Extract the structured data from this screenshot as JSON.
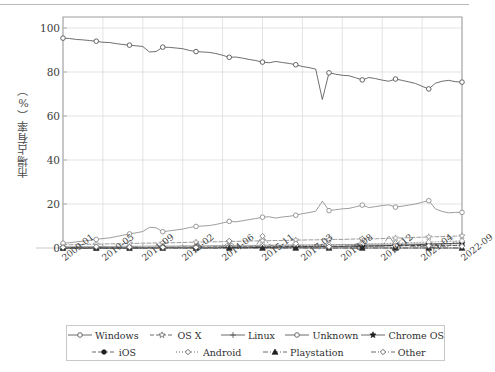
{
  "chart_data": {
    "type": "line",
    "title": "",
    "xlabel": "",
    "ylabel": "市場占有率（%）",
    "ylim": [
      0,
      105
    ],
    "yticks": [
      0,
      20,
      40,
      60,
      80,
      100
    ],
    "grid": true,
    "legend_position": "bottom",
    "x_tick_labels": [
      "2009-01",
      "2010-05",
      "2011-09",
      "2013-02",
      "2014-06",
      "2015-11",
      "2017-03",
      "2018-08",
      "2019-12",
      "2021-04",
      "2022-09"
    ],
    "x_range": [
      "2009-01",
      "2022-09"
    ],
    "series": [
      {
        "name": "Windows",
        "marker": "circle-open",
        "linestyle": "solid",
        "color": "#555555",
        "values": [
          95.4,
          95.2,
          94.8,
          94.6,
          94.3,
          94.0,
          93.5,
          93.4,
          92.9,
          92.5,
          92.2,
          91.9,
          91.6,
          89.1,
          89.3,
          91.3,
          91.2,
          90.9,
          90.6,
          89.8,
          89.3,
          89.1,
          88.9,
          88.4,
          87.6,
          86.7,
          86.8,
          86.3,
          85.7,
          85.2,
          84.5,
          84.2,
          84.8,
          84.3,
          83.9,
          83.3,
          82.5,
          82.0,
          81.3,
          67.5,
          79.6,
          79.0,
          78.5,
          78.3,
          77.4,
          76.4,
          77.5,
          77.0,
          76.3,
          75.8,
          76.8,
          76.2,
          75.5,
          74.8,
          73.5,
          72.3,
          74.9,
          75.8,
          76.2,
          75.6,
          75.4
        ]
      },
      {
        "name": "OS X",
        "marker": "star",
        "linestyle": "dashed",
        "color": "#8a8a8a",
        "values": [
          1.4,
          1.5,
          1.5,
          1.6,
          1.7,
          1.7,
          1.8,
          1.9,
          1.9,
          2.0,
          2.1,
          2.1,
          2.2,
          2.2,
          2.3,
          2.3,
          2.4,
          2.4,
          2.5,
          2.6,
          2.6,
          2.7,
          2.8,
          2.8,
          2.9,
          3.0,
          3.0,
          3.1,
          3.2,
          3.2,
          3.3,
          3.3,
          3.4,
          3.4,
          3.5,
          3.6,
          3.6,
          3.7,
          3.7,
          3.8,
          3.8,
          3.9,
          3.9,
          4.0,
          4.1,
          4.1,
          4.2,
          4.2,
          4.3,
          4.4,
          4.5,
          4.6,
          4.7,
          4.8,
          4.9,
          5.0,
          5.1,
          5.2,
          5.3,
          5.4,
          5.5
        ]
      },
      {
        "name": "Linux",
        "marker": "plus",
        "linestyle": "solid",
        "color": "#9a9a9a",
        "values": [
          0.6,
          0.6,
          0.6,
          0.6,
          0.7,
          0.7,
          0.7,
          0.7,
          0.7,
          0.8,
          0.8,
          0.8,
          0.8,
          0.9,
          0.9,
          0.9,
          0.9,
          0.9,
          1.0,
          1.0,
          1.0,
          1.0,
          1.1,
          1.1,
          1.1,
          1.1,
          1.2,
          1.2,
          1.2,
          1.2,
          1.3,
          1.3,
          1.3,
          1.3,
          1.4,
          1.4,
          1.4,
          1.4,
          1.5,
          1.5,
          1.5,
          1.5,
          1.6,
          1.6,
          1.6,
          1.6,
          1.7,
          1.7,
          1.7,
          1.7,
          1.8,
          1.8,
          1.8,
          1.9,
          1.9,
          1.9,
          2.0,
          2.0,
          2.0,
          2.1,
          2.1
        ]
      },
      {
        "name": "Unknown",
        "marker": "circle-open",
        "linestyle": "solid",
        "color": "#8d8d8d",
        "values": [
          2.2,
          2.4,
          2.8,
          3.1,
          3.5,
          3.9,
          4.3,
          4.6,
          5.2,
          5.8,
          6.4,
          6.9,
          7.5,
          9.4,
          9.2,
          7.4,
          7.8,
          8.2,
          8.6,
          9.3,
          9.8,
          10.0,
          10.2,
          10.7,
          11.4,
          12.1,
          11.9,
          12.4,
          12.9,
          13.4,
          14.0,
          14.2,
          13.6,
          14.1,
          14.4,
          14.9,
          15.6,
          16.1,
          16.7,
          21.3,
          17.0,
          17.4,
          17.8,
          18.0,
          18.7,
          19.5,
          18.4,
          18.8,
          19.3,
          19.6,
          18.6,
          19.0,
          19.5,
          20.0,
          20.8,
          21.5,
          17.8,
          16.6,
          16.0,
          16.2,
          16.2
        ]
      },
      {
        "name": "Chrome OS",
        "marker": "star-filled",
        "linestyle": "solid",
        "color": "#3a3a3a",
        "values": [
          0.0,
          0.0,
          0.0,
          0.0,
          0.0,
          0.0,
          0.0,
          0.0,
          0.0,
          0.0,
          0.0,
          0.0,
          0.0,
          0.1,
          0.1,
          0.1,
          0.1,
          0.1,
          0.1,
          0.1,
          0.1,
          0.1,
          0.1,
          0.1,
          0.2,
          0.2,
          0.2,
          0.2,
          0.2,
          0.2,
          0.3,
          0.3,
          0.3,
          0.3,
          0.4,
          0.4,
          0.4,
          0.5,
          0.5,
          0.6,
          0.6,
          0.7,
          0.7,
          0.8,
          0.8,
          0.9,
          0.9,
          1.0,
          1.0,
          1.1,
          1.2,
          1.3,
          1.4,
          1.5,
          1.6,
          1.7,
          1.8,
          1.9,
          2.0,
          2.1,
          2.2
        ]
      },
      {
        "name": "iOS",
        "marker": "circle-filled",
        "linestyle": "dashed",
        "color": "#1f1f1f",
        "values": [
          0.1,
          0.1,
          0.1,
          0.1,
          0.1,
          0.1,
          0.1,
          0.1,
          0.2,
          0.2,
          0.2,
          0.2,
          0.2,
          0.3,
          0.3,
          0.3,
          0.3,
          0.3,
          0.4,
          0.4,
          0.4,
          0.4,
          0.4,
          0.5,
          0.5,
          0.5,
          0.5,
          0.5,
          0.6,
          0.6,
          0.6,
          0.6,
          0.6,
          0.7,
          0.7,
          0.7,
          0.7,
          0.7,
          0.8,
          0.8,
          0.8,
          0.8,
          0.8,
          0.9,
          0.9,
          0.9,
          0.9,
          0.9,
          1.0,
          1.0,
          1.0,
          1.0,
          1.1,
          1.1,
          1.1,
          1.1,
          1.2,
          1.2,
          1.2,
          1.2,
          1.3
        ]
      },
      {
        "name": "Android",
        "marker": "diamond-open",
        "linestyle": "dotted",
        "color": "#909090",
        "values": [
          0.0,
          0.0,
          0.0,
          0.0,
          0.0,
          0.0,
          0.0,
          0.1,
          0.1,
          0.1,
          0.1,
          0.1,
          0.2,
          0.2,
          0.2,
          0.2,
          0.3,
          0.3,
          0.3,
          0.4,
          0.4,
          0.4,
          0.5,
          0.5,
          0.6,
          0.6,
          0.7,
          0.7,
          0.8,
          0.8,
          0.9,
          0.9,
          1.0,
          1.0,
          1.1,
          1.1,
          1.2,
          1.2,
          1.3,
          1.4,
          1.4,
          1.5,
          1.6,
          1.6,
          1.7,
          1.8,
          1.9,
          1.9,
          2.0,
          2.1,
          2.2,
          2.3,
          2.4,
          2.5,
          2.6,
          2.7,
          2.8,
          2.9,
          3.0,
          3.1,
          3.2
        ]
      },
      {
        "name": "Playstation",
        "marker": "triangle-filled",
        "linestyle": "dashdot",
        "color": "#2a2a2a",
        "values": [
          0.0,
          0.0,
          0.0,
          0.0,
          0.0,
          0.0,
          0.0,
          0.0,
          0.0,
          0.0,
          0.0,
          0.0,
          0.0,
          0.0,
          0.0,
          0.0,
          0.0,
          0.0,
          0.0,
          0.0,
          0.0,
          0.0,
          0.0,
          0.0,
          0.0,
          0.0,
          0.0,
          0.0,
          0.0,
          0.0,
          0.0,
          0.0,
          0.0,
          0.0,
          0.0,
          0.0,
          0.0,
          0.0,
          0.0,
          0.0,
          0.0,
          0.0,
          0.0,
          0.0,
          0.0,
          0.0,
          0.0,
          0.0,
          0.0,
          0.0,
          0.0,
          0.0,
          0.0,
          0.0,
          0.0,
          0.0,
          0.0,
          0.0,
          0.0,
          0.0,
          0.0
        ]
      },
      {
        "name": "Other",
        "marker": "diamond-open",
        "linestyle": "dashdot",
        "color": "#7e7e7e",
        "values": [
          0.3,
          0.2,
          0.2,
          0.3,
          0.2,
          0.6,
          0.4,
          0.3,
          0.2,
          0.2,
          0.4,
          0.5,
          0.3,
          0.2,
          0.2,
          0.3,
          0.4,
          0.3,
          0.2,
          0.3,
          0.3,
          0.2,
          0.2,
          0.2,
          0.3,
          3.2,
          0.5,
          0.3,
          0.4,
          1.0,
          5.4,
          1.6,
          0.4,
          0.3,
          0.5,
          2.0,
          0.4,
          0.3,
          0.5,
          1.2,
          0.6,
          0.5,
          0.4,
          0.6,
          0.5,
          4.2,
          0.7,
          0.5,
          0.6,
          5.6,
          1.1,
          4.4,
          0.8,
          0.6,
          0.7,
          1.0,
          0.8,
          0.6,
          0.9,
          3.1,
          0.8
        ]
      }
    ]
  },
  "legend": {
    "rows": [
      [
        {
          "label": "Windows",
          "marker": "circle-open",
          "linestyle": "solid"
        },
        {
          "label": "OS X",
          "marker": "star",
          "linestyle": "dashed"
        },
        {
          "label": "Linux",
          "marker": "plus",
          "linestyle": "solid"
        },
        {
          "label": "Unknown",
          "marker": "circle-open",
          "linestyle": "solid"
        },
        {
          "label": "Chrome OS",
          "marker": "star-filled",
          "linestyle": "solid"
        }
      ],
      [
        {
          "label": "iOS",
          "marker": "circle-filled",
          "linestyle": "dashed"
        },
        {
          "label": "Android",
          "marker": "diamond-open",
          "linestyle": "dotted"
        },
        {
          "label": "Playstation",
          "marker": "triangle-filled",
          "linestyle": "dashdot"
        },
        {
          "label": "Other",
          "marker": "diamond-open",
          "linestyle": "dashdot"
        }
      ]
    ]
  },
  "axes": {
    "y_tick_labels": [
      "0",
      "20",
      "40",
      "60",
      "80",
      "100"
    ],
    "grid_color": "#dcdcdc",
    "frame_color": "#9e9e9e"
  }
}
